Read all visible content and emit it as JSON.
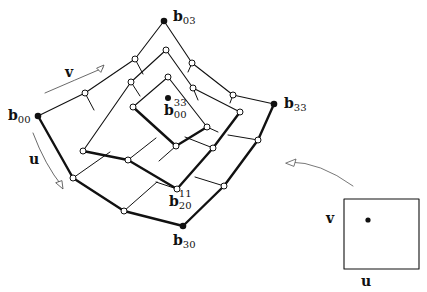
{
  "labels": {
    "b03": {
      "base": "b",
      "sub": "03"
    },
    "b00": {
      "base": "b",
      "sub": "00"
    },
    "b33": {
      "base": "b",
      "sub": "33"
    },
    "b30": {
      "base": "b",
      "sub": "30"
    },
    "b20_11": {
      "base": "b",
      "sup": "11",
      "sub": "20"
    },
    "b00_33": {
      "base": "b",
      "sup": "33",
      "sub": "00"
    },
    "v_patch": "v",
    "u_patch": "u",
    "v_domain": "v",
    "u_domain": "u"
  },
  "colors": {
    "line": "#111111",
    "background": "#ffffff",
    "arrow": "#555555"
  },
  "nodes": {
    "corner_points": [
      "b00",
      "b03",
      "b33",
      "b30"
    ],
    "center_point": "b00^33"
  }
}
